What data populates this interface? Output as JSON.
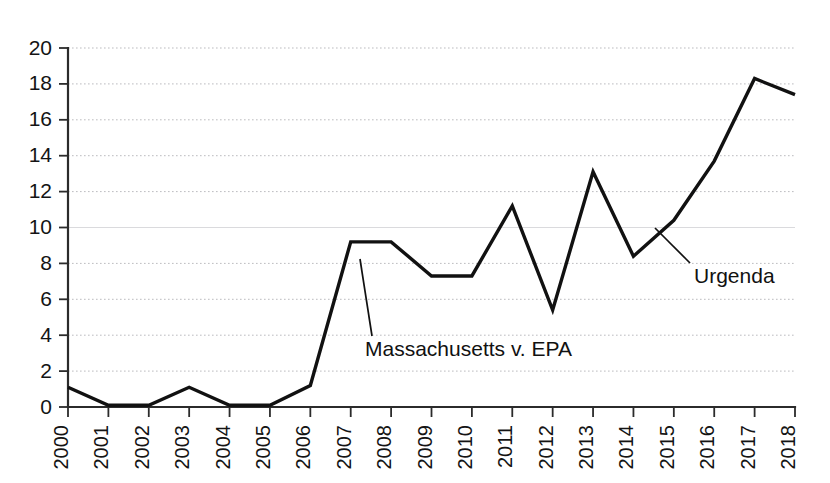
{
  "chart_data": {
    "type": "line",
    "title": "",
    "subtitle": "",
    "xlabel": "",
    "ylabel": "",
    "categories": [
      "2000",
      "2001",
      "2002",
      "2003",
      "2004",
      "2005",
      "2006",
      "2007",
      "2008",
      "2009",
      "2010",
      "2011",
      "2012",
      "2013",
      "2014",
      "2015",
      "2016",
      "2017",
      "2018"
    ],
    "values": [
      1.1,
      0.1,
      0.1,
      1.1,
      0.1,
      0.1,
      1.2,
      9.2,
      9.2,
      7.3,
      7.3,
      11.2,
      5.4,
      13.1,
      8.4,
      10.4,
      13.7,
      18.3,
      17.4
    ],
    "series": [
      {
        "name": "Climate litigation cases",
        "values": [
          1.1,
          0.1,
          0.1,
          1.1,
          0.1,
          0.1,
          1.2,
          9.2,
          9.2,
          7.3,
          7.3,
          11.2,
          5.4,
          13.1,
          8.4,
          10.4,
          13.7,
          18.3,
          17.4
        ]
      }
    ],
    "ylim": [
      0,
      20
    ],
    "ytick_step": 2,
    "yticks": [
      "0",
      "2",
      "4",
      "6",
      "8",
      "10",
      "12",
      "14",
      "16",
      "18",
      "20"
    ],
    "xlim": [
      "2000",
      "2018"
    ],
    "grid": true,
    "grid_axis": "y",
    "grid_style": "dotted",
    "legend": false,
    "legend_position": "none",
    "line_color": "#111111",
    "grid_color": "#b9b9bd",
    "axis_color": "#2b2b2b",
    "xtick_rotation": -90,
    "annotations": [
      {
        "id": "massachusetts-v-epa",
        "text": "Massachusetts v. EPA",
        "points_to_year": "2007",
        "points_to_value": 8.2,
        "label_x": 365,
        "label_y": 350,
        "leader_from_x": 372,
        "leader_from_y": 336,
        "leader_to_x": 360,
        "leader_to_y": 259
      },
      {
        "id": "urgenda",
        "text": "Urgenda",
        "points_to_year": "2015",
        "points_to_value": 11.2,
        "label_x": 694,
        "label_y": 277,
        "leader_from_x": 690,
        "leader_from_y": 263,
        "leader_to_x": 655,
        "leader_to_y": 228
      }
    ]
  },
  "plot_geometry": {
    "left": 68,
    "right": 795,
    "top": 48,
    "bottom": 407
  }
}
